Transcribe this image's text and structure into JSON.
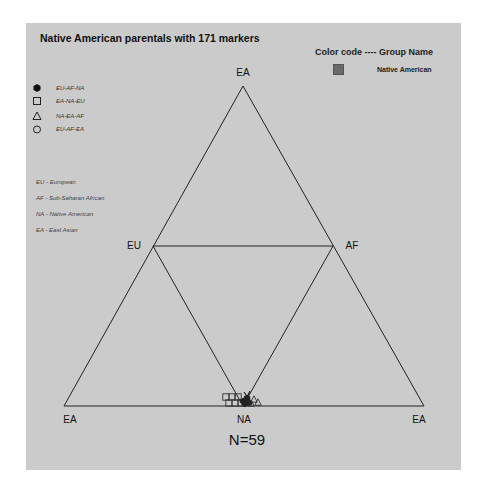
{
  "chart_data": {
    "type": "scatter",
    "subtype": "ternary-triangle",
    "title": "Native American parentals with 171 markers",
    "color_code_header": "Color code ---- Group Name",
    "groups": [
      {
        "name": "Native American",
        "color": "#6a6a6a"
      }
    ],
    "symbol_legend": [
      {
        "symbol": "filled-hexagon",
        "label": "EU-AF-NA"
      },
      {
        "symbol": "square",
        "label": "EA-NA-EU"
      },
      {
        "symbol": "triangle",
        "label": "NA-EA-AF"
      },
      {
        "symbol": "circle",
        "label": "EU-AF-EA"
      }
    ],
    "abbreviations": [
      "EU - European",
      "AF - Sub-Saharan African",
      "NA - Native American",
      "EA - East Asian"
    ],
    "vertex_labels": {
      "top": "EA",
      "mid_left": "EU",
      "mid_right": "AF",
      "bottom_left": "EA",
      "bottom_center": "NA",
      "bottom_right": "EA"
    },
    "n_label": "N=59",
    "n": 59,
    "points_note": "All samples cluster tightly at the NA vertex (bottom center)",
    "points": [
      {
        "symbol": "square",
        "x": 226,
        "y": 397
      },
      {
        "symbol": "square",
        "x": 232,
        "y": 397
      },
      {
        "symbol": "square",
        "x": 238,
        "y": 397
      },
      {
        "symbol": "square",
        "x": 229,
        "y": 403
      },
      {
        "symbol": "square",
        "x": 235,
        "y": 403
      },
      {
        "symbol": "square",
        "x": 241,
        "y": 403
      },
      {
        "symbol": "filled-hexagon",
        "x": 243,
        "y": 401
      },
      {
        "symbol": "filled-hexagon",
        "x": 247,
        "y": 398
      },
      {
        "symbol": "filled-hexagon",
        "x": 249,
        "y": 403
      },
      {
        "symbol": "filled-hexagon",
        "x": 245,
        "y": 404
      },
      {
        "symbol": "triangle",
        "x": 254,
        "y": 399
      },
      {
        "symbol": "triangle",
        "x": 258,
        "y": 402
      },
      {
        "symbol": "triangle",
        "x": 251,
        "y": 403
      }
    ]
  }
}
